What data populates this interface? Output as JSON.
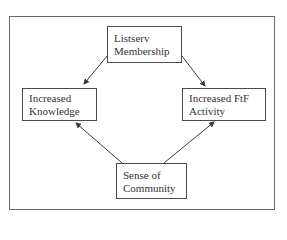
{
  "diagram": {
    "nodes": {
      "listserv": {
        "line1": "Listserv",
        "line2": "Membership"
      },
      "knowledge": {
        "line1": "Increased",
        "line2": "Knowledge"
      },
      "ftf": {
        "line1": "Increased FtF",
        "line2": "Activity"
      },
      "community": {
        "line1": "Sense of",
        "line2": "Community"
      }
    },
    "edges": [
      {
        "from": "Listserv Membership",
        "to": "Increased Knowledge"
      },
      {
        "from": "Listserv Membership",
        "to": "Increased FtF Activity"
      },
      {
        "from": "Sense of Community",
        "to": "Increased Knowledge"
      },
      {
        "from": "Sense of Community",
        "to": "Increased FtF Activity"
      }
    ],
    "colors": {
      "line": "#3a3a3a",
      "border": "#4a4a4a",
      "text": "#333333"
    }
  }
}
